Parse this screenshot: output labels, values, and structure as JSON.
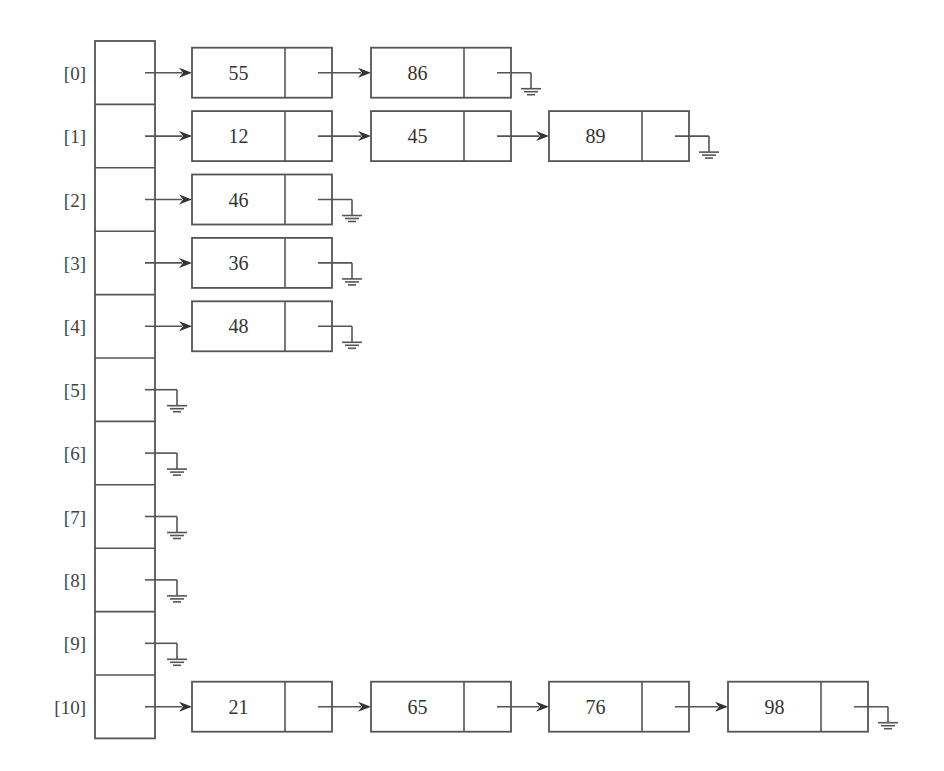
{
  "diagram": {
    "type": "hash-table-separate-chaining",
    "buckets": [
      {
        "index": "[0]",
        "chain": [
          "55",
          "86"
        ]
      },
      {
        "index": "[1]",
        "chain": [
          "12",
          "45",
          "89"
        ]
      },
      {
        "index": "[2]",
        "chain": [
          "46"
        ]
      },
      {
        "index": "[3]",
        "chain": [
          "36"
        ]
      },
      {
        "index": "[4]",
        "chain": [
          "48"
        ]
      },
      {
        "index": "[5]",
        "chain": []
      },
      {
        "index": "[6]",
        "chain": []
      },
      {
        "index": "[7]",
        "chain": []
      },
      {
        "index": "[8]",
        "chain": []
      },
      {
        "index": "[9]",
        "chain": []
      },
      {
        "index": "[10]",
        "chain": [
          "21",
          "65",
          "76",
          "98"
        ]
      }
    ],
    "null_symbol": "ground-icon",
    "colors": {
      "line": "#555555",
      "text": "#333333",
      "background": "#ffffff"
    }
  }
}
